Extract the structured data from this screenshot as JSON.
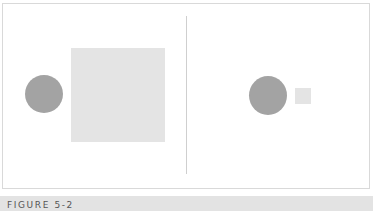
{
  "figure": {
    "caption": "FIGURE 5-2",
    "panels": [
      {
        "name": "left-panel",
        "circle": {
          "cx": 44,
          "cy": 94,
          "r": 19,
          "color": "#a3a3a3"
        },
        "square": {
          "x": 71,
          "y": 48,
          "size": 94,
          "color": "#e4e4e4"
        }
      },
      {
        "name": "right-panel",
        "circle": {
          "cx": 268,
          "cy": 95,
          "r": 19,
          "color": "#a3a3a3"
        },
        "square": {
          "x": 295,
          "y": 88,
          "size": 16,
          "color": "#e4e4e4"
        }
      }
    ]
  }
}
